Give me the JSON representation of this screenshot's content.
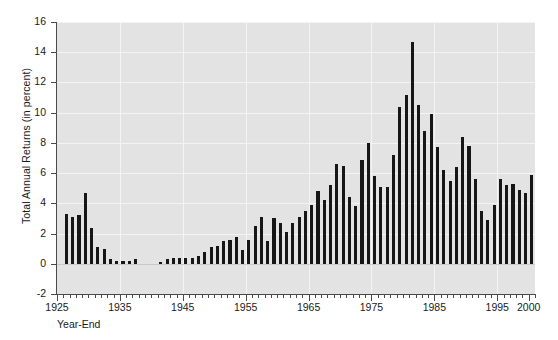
{
  "chart_data": {
    "type": "bar",
    "title": "",
    "subtitle": "",
    "xlabel": "Year-End",
    "ylabel": "Total Annual Returns (in percent)",
    "ylim": [
      -2,
      16
    ],
    "xlim": [
      1925,
      2001
    ],
    "yticks": [
      -2,
      0,
      2,
      4,
      6,
      8,
      10,
      12,
      14,
      16
    ],
    "xticks": [
      1925,
      1935,
      1945,
      1955,
      1965,
      1975,
      1985,
      1995,
      2000
    ],
    "xtick_labels": [
      "1925",
      "1935",
      "1945",
      "1955",
      "1965",
      "1975",
      "1985",
      "1995",
      "2000"
    ],
    "grid": true,
    "grid_color": "#f4f4f4",
    "plot_background": "#e3e3e3",
    "bar_color": "#161616",
    "legend": null,
    "annotations": [],
    "categories": [
      1926,
      1927,
      1928,
      1929,
      1930,
      1931,
      1932,
      1933,
      1934,
      1935,
      1936,
      1937,
      1938,
      1939,
      1940,
      1941,
      1942,
      1943,
      1944,
      1945,
      1946,
      1947,
      1948,
      1949,
      1950,
      1951,
      1952,
      1953,
      1954,
      1955,
      1956,
      1957,
      1958,
      1959,
      1960,
      1961,
      1962,
      1963,
      1964,
      1965,
      1966,
      1967,
      1968,
      1969,
      1970,
      1971,
      1972,
      1973,
      1974,
      1975,
      1976,
      1977,
      1978,
      1979,
      1980,
      1981,
      1982,
      1983,
      1984,
      1985,
      1986,
      1987,
      1988,
      1989,
      1990,
      1991,
      1992,
      1993,
      1994,
      1995,
      1996,
      1997,
      1998,
      1999,
      2000
    ],
    "values": [
      3.3,
      3.1,
      3.2,
      4.7,
      2.4,
      1.1,
      1.0,
      0.3,
      0.2,
      0.2,
      0.2,
      0.3,
      0.0,
      0.0,
      0.0,
      0.1,
      0.3,
      0.4,
      0.4,
      0.4,
      0.4,
      0.5,
      0.8,
      1.1,
      1.2,
      1.5,
      1.6,
      1.8,
      0.9,
      1.6,
      2.5,
      3.1,
      1.5,
      3.0,
      2.7,
      2.1,
      2.7,
      3.1,
      3.5,
      3.9,
      4.8,
      4.2,
      5.2,
      6.6,
      6.5,
      4.4,
      3.8,
      6.9,
      8.0,
      5.8,
      5.1,
      5.1,
      7.2,
      10.4,
      11.2,
      14.7,
      10.5,
      8.8,
      9.9,
      7.7,
      6.2,
      5.5,
      6.4,
      8.4,
      7.8,
      5.6,
      3.5,
      2.9,
      3.9,
      5.6,
      5.2,
      5.3,
      4.9,
      4.7,
      5.9
    ]
  }
}
